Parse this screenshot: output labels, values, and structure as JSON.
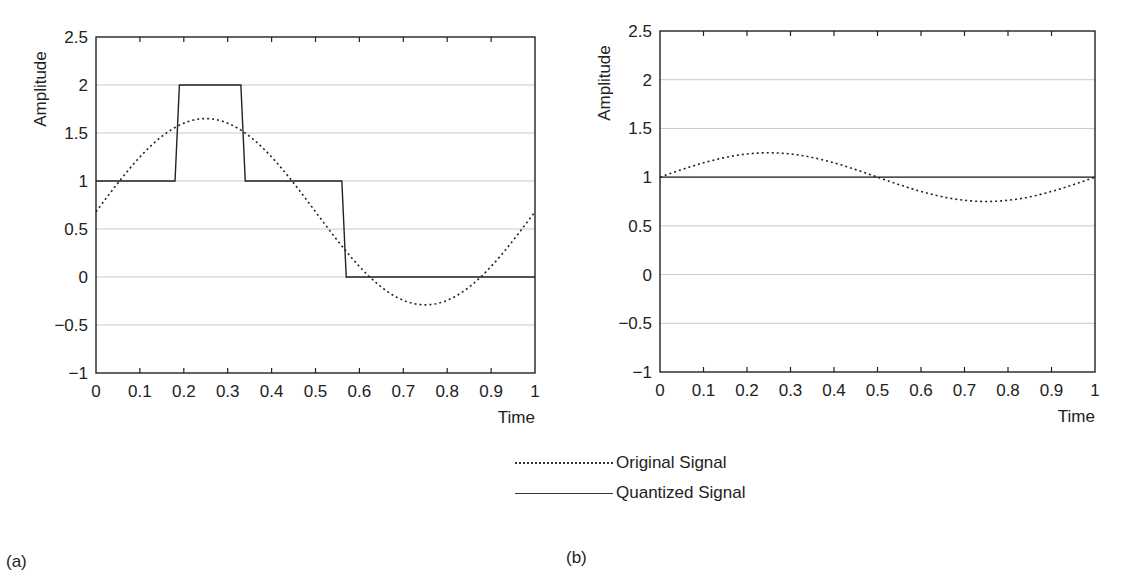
{
  "chart_data": [
    {
      "type": "line",
      "panel": "(a)",
      "xlabel": "Time",
      "ylabel": "Amplitude",
      "xlim": [
        0,
        1
      ],
      "ylim": [
        -1,
        2.5
      ],
      "xticks": [
        "0",
        "0.1",
        "0.2",
        "0.3",
        "0.4",
        "0.5",
        "0.6",
        "0.7",
        "0.8",
        "0.9",
        "1"
      ],
      "yticks": [
        "−1",
        "−0.5",
        "0",
        "0.5",
        "1",
        "1.5",
        "2",
        "2.5"
      ],
      "grid": "horizontal",
      "series": [
        {
          "name": "Original Signal",
          "style": "dotted",
          "function": "0.68 + 0.97*sin(2*pi*t)",
          "x": [
            0,
            0.1,
            0.2,
            0.25,
            0.3,
            0.4,
            0.5,
            0.6,
            0.7,
            0.75,
            0.8,
            0.9,
            1.0
          ],
          "values": [
            0.72,
            1.25,
            1.6,
            1.65,
            1.6,
            1.25,
            0.68,
            0.11,
            -0.24,
            -0.29,
            -0.24,
            0.11,
            0.42
          ]
        },
        {
          "name": "Quantized Signal",
          "style": "solid",
          "x": [
            0,
            0.18,
            0.19,
            0.33,
            0.34,
            0.56,
            0.57,
            1.0
          ],
          "values": [
            1,
            1,
            2,
            2,
            1,
            1,
            0,
            0
          ]
        }
      ]
    },
    {
      "type": "line",
      "panel": "(b)",
      "xlabel": "Time",
      "ylabel": "Amplitude",
      "xlim": [
        0,
        1
      ],
      "ylim": [
        -1,
        2.5
      ],
      "xticks": [
        "0",
        "0.1",
        "0.2",
        "0.3",
        "0.4",
        "0.5",
        "0.6",
        "0.7",
        "0.8",
        "0.9",
        "1"
      ],
      "yticks": [
        "−1",
        "−0.5",
        "0",
        "0.5",
        "1",
        "1.5",
        "2",
        "2.5"
      ],
      "grid": "horizontal",
      "series": [
        {
          "name": "Original Signal",
          "style": "dotted",
          "function": "1 + 0.25*sin(2*pi*t)",
          "x": [
            0,
            0.25,
            0.5,
            0.75,
            1.0
          ],
          "values": [
            0.95,
            1.22,
            1.0,
            0.72,
            0.9
          ]
        },
        {
          "name": "Quantized Signal",
          "style": "solid",
          "x": [
            0,
            1
          ],
          "values": [
            1,
            1
          ]
        }
      ]
    }
  ],
  "legend": [
    {
      "label": "Original Signal",
      "style": "dotted"
    },
    {
      "label": "Quantized Signal",
      "style": "solid"
    }
  ],
  "panel_labels": [
    "(a)",
    "(b)"
  ]
}
